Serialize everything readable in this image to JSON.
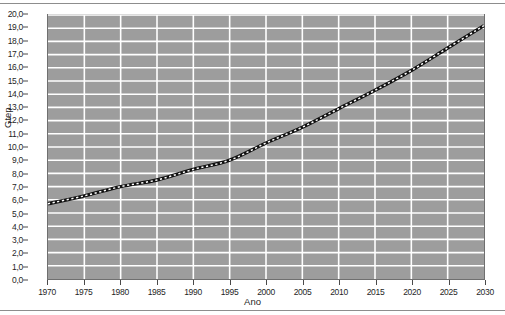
{
  "chart_data": {
    "type": "line",
    "title": "",
    "xlabel": "Ano",
    "ylabel": "Gtep",
    "xlim": [
      1970,
      2030
    ],
    "ylim": [
      0.0,
      20.0
    ],
    "grid": true,
    "legend": false,
    "legend_position": "none",
    "decimal_separator": ",",
    "xticks": [
      1970,
      1975,
      1980,
      1985,
      1990,
      1995,
      2000,
      2005,
      2010,
      2015,
      2020,
      2025,
      2030
    ],
    "xtick_labels": [
      "1970",
      "1975",
      "1980",
      "1985",
      "1990",
      "1995",
      "2000",
      "2005",
      "2010",
      "2015",
      "2020",
      "2025",
      "2030"
    ],
    "yticks": [
      0,
      1,
      2,
      3,
      4,
      5,
      6,
      7,
      8,
      9,
      10,
      11,
      12,
      13,
      14,
      15,
      16,
      17,
      18,
      19,
      20
    ],
    "ytick_labels": [
      "0,0",
      "1,0",
      "2,0",
      "3,0",
      "4,0",
      "5,0",
      "6,0",
      "7,0",
      "8,0",
      "9,0",
      "10,0",
      "11,0",
      "12,0",
      "13,0",
      "14,0",
      "15,0",
      "16,0",
      "17,0",
      "18,0",
      "19,0",
      "20,0"
    ],
    "style": {
      "plot_background": "#9d9d9d",
      "gridline_color": "#ffffff",
      "series_color": "#111111",
      "series_marker_color": "#ffffff",
      "axis_text_color": "#1f1f1f",
      "frame_color": "#6f6f6f"
    },
    "series": [
      {
        "name": "Consumo mundial de energia",
        "line_style": "dotted-dashed",
        "marker": "square",
        "x": [
          1970,
          1975,
          1980,
          1985,
          1990,
          1995,
          2000,
          2005,
          2010,
          2015,
          2020,
          2025,
          2030
        ],
        "values": [
          5.7,
          6.3,
          7.0,
          7.5,
          8.3,
          9.0,
          10.3,
          11.5,
          12.9,
          14.3,
          15.8,
          17.5,
          19.2
        ]
      }
    ]
  }
}
